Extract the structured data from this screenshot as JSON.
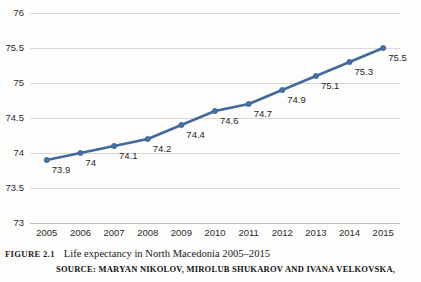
{
  "figure": {
    "number_label": "FIGURE 2.1",
    "title": "Life expectancy in North Macedonia 2005–2015",
    "source": "SOURCE: MARYAN NIKOLOV, MIROLUB SHUKAROV AND IVANA VELKOVSKA,"
  },
  "chart_data": {
    "type": "line",
    "title": "Life expectancy in North Macedonia 2005–2015",
    "xlabel": "",
    "ylabel": "",
    "categories": [
      "2005",
      "2006",
      "2007",
      "2008",
      "2009",
      "2010",
      "2011",
      "2012",
      "2013",
      "2014",
      "2015"
    ],
    "values": [
      73.9,
      74,
      74.1,
      74.2,
      74.4,
      74.6,
      74.7,
      74.9,
      75.1,
      75.3,
      75.5
    ],
    "point_labels": [
      "73.9",
      "74",
      "74.1",
      "74.2",
      "74.4",
      "74.6",
      "74.7",
      "74.9",
      "75.1",
      "75.3",
      "75.5"
    ],
    "ylim": [
      73,
      76
    ],
    "ytick_labels": [
      "73",
      "73.5",
      "74",
      "74.5",
      "75",
      "75.5",
      "76"
    ],
    "ytick_values": [
      73,
      73.5,
      74,
      74.5,
      75,
      75.5,
      76
    ],
    "grid": true,
    "legend": false,
    "series_color": "#41699b",
    "marker_color": "#4472a4",
    "gridline_color": "#d9d9d9"
  }
}
